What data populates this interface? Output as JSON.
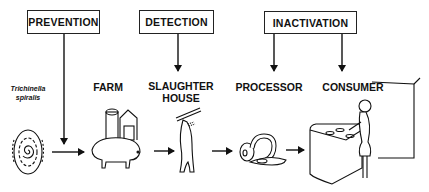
{
  "control_boxes": [
    {
      "id": "prevention",
      "label": "PREVENTION"
    },
    {
      "id": "detection",
      "label": "DETECTION"
    },
    {
      "id": "inactivation",
      "label": "INACTIVATION"
    }
  ],
  "stages": [
    {
      "id": "parasite",
      "label_line1": "Trichinella",
      "label_line2": "spiralis",
      "icon": "parasite-cyst-icon"
    },
    {
      "id": "farm",
      "label": "FARM",
      "icon": "pig-with-barn-icon"
    },
    {
      "id": "slaughterhouse",
      "label_line1": "SLAUGHTER",
      "label_line2": "HOUSE",
      "icon": "hanging-carcass-icon"
    },
    {
      "id": "processor",
      "label": "PROCESSOR",
      "icon": "sausage-ham-icon"
    },
    {
      "id": "consumer",
      "label": "CONSUMER",
      "icon": "woman-at-stove-icon"
    }
  ],
  "connections": [
    {
      "from": "prevention",
      "to": "flow-parasite-to-farm"
    },
    {
      "from": "detection",
      "to": "slaughterhouse"
    },
    {
      "from": "inactivation",
      "to": "processor"
    },
    {
      "from": "inactivation",
      "to": "consumer"
    }
  ],
  "colors": {
    "ink": "#111111",
    "background": "#ffffff"
  }
}
